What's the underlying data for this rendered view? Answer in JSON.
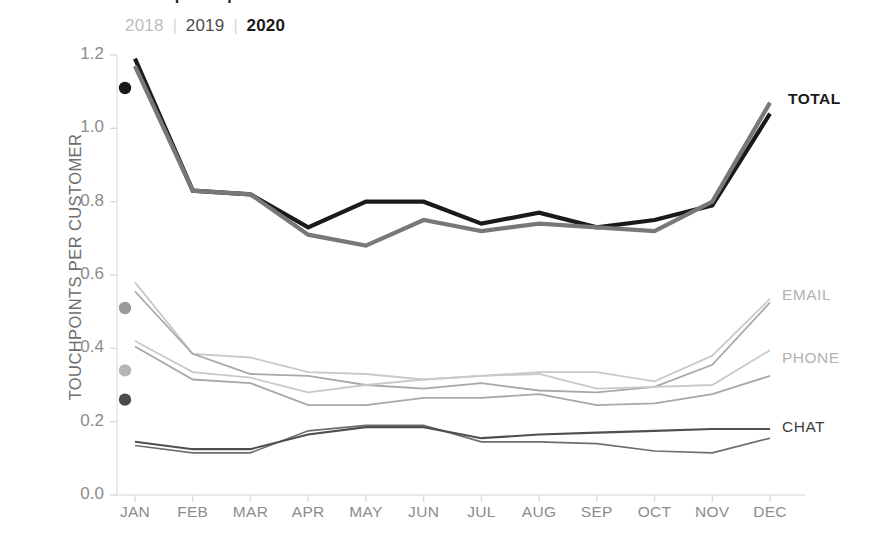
{
  "title": "Touchpoints per customer",
  "legend": {
    "items": [
      {
        "label": "2018",
        "color": "#bdbdbd"
      },
      {
        "label": "2019",
        "color": "#4d4d4d"
      },
      {
        "label": "2020",
        "color": "#1a1a1a"
      }
    ],
    "separator": "|"
  },
  "axes": {
    "y_title": "TOUCHPOINTS PER CUSTOMER",
    "y_ticks": [
      "0.0",
      "0.2",
      "0.4",
      "0.6",
      "0.8",
      "1.0",
      "1.2"
    ],
    "x_ticks": [
      "JAN",
      "FEB",
      "MAR",
      "APR",
      "MAY",
      "JUN",
      "JUL",
      "AUG",
      "SEP",
      "OCT",
      "NOV",
      "DEC"
    ]
  },
  "series_labels": {
    "total": "TOTAL",
    "email": "EMAIL",
    "phone": "PHONE",
    "chat": "CHAT"
  },
  "chart_data": {
    "type": "line",
    "title": "Touchpoints per customer",
    "xlabel": "",
    "ylabel": "TOUCHPOINTS PER CUSTOMER",
    "ylim": [
      0.0,
      1.2
    ],
    "ytick_step": 0.2,
    "grid": false,
    "legend_position": "top-left",
    "categories": [
      "JAN",
      "FEB",
      "MAR",
      "APR",
      "MAY",
      "JUN",
      "JUL",
      "AUG",
      "SEP",
      "OCT",
      "NOV",
      "DEC"
    ],
    "series": [
      {
        "name": "TOTAL 2020",
        "metric": "TOTAL",
        "year": "2020",
        "color": "#1a1a1a",
        "width": 4.2,
        "values": [
          1.19,
          0.83,
          0.82,
          0.73,
          0.8,
          0.8,
          0.74,
          0.77,
          0.73,
          0.75,
          0.79,
          1.04
        ]
      },
      {
        "name": "TOTAL 2019",
        "metric": "TOTAL",
        "year": "2019",
        "color": "#787878",
        "width": 4.2,
        "values": [
          1.17,
          0.83,
          0.82,
          0.71,
          0.68,
          0.75,
          0.72,
          0.74,
          0.73,
          0.72,
          0.8,
          1.07
        ]
      },
      {
        "name": "EMAIL 2018",
        "metric": "EMAIL",
        "year": "2018",
        "color": "#c9c9c9",
        "width": 1.8,
        "values": [
          0.58,
          0.385,
          0.375,
          0.335,
          0.33,
          0.315,
          0.325,
          0.335,
          0.335,
          0.31,
          0.38,
          0.535
        ]
      },
      {
        "name": "EMAIL 2019",
        "metric": "EMAIL",
        "year": "2019",
        "color": "#a8a8a8",
        "width": 1.8,
        "values": [
          0.555,
          0.385,
          0.33,
          0.325,
          0.3,
          0.29,
          0.305,
          0.285,
          0.28,
          0.295,
          0.355,
          0.525
        ]
      },
      {
        "name": "PHONE 2018",
        "metric": "PHONE",
        "year": "2018",
        "color": "#c9c9c9",
        "width": 1.8,
        "values": [
          0.42,
          0.335,
          0.32,
          0.28,
          0.3,
          0.315,
          0.325,
          0.33,
          0.29,
          0.295,
          0.3,
          0.395
        ]
      },
      {
        "name": "PHONE 2019",
        "metric": "PHONE",
        "year": "2019",
        "color": "#a8a8a8",
        "width": 1.8,
        "values": [
          0.405,
          0.315,
          0.305,
          0.245,
          0.245,
          0.265,
          0.265,
          0.275,
          0.245,
          0.25,
          0.275,
          0.325
        ]
      },
      {
        "name": "CHAT 2020",
        "metric": "CHAT",
        "year": "2020",
        "color": "#4f4f4f",
        "width": 2.1,
        "values": [
          0.145,
          0.125,
          0.125,
          0.165,
          0.185,
          0.185,
          0.155,
          0.165,
          0.17,
          0.175,
          0.18,
          0.18
        ]
      },
      {
        "name": "CHAT 2019",
        "metric": "CHAT",
        "year": "2019",
        "color": "#6e6e6e",
        "width": 1.6,
        "values": [
          0.135,
          0.115,
          0.115,
          0.175,
          0.19,
          0.19,
          0.145,
          0.145,
          0.14,
          0.12,
          0.115,
          0.155
        ]
      }
    ],
    "markers": [
      {
        "label": "TOTAL 2018 JAN",
        "metric": "TOTAL",
        "year": "2018",
        "x": "JAN",
        "value": 1.11,
        "color": "#1a1a1a"
      },
      {
        "label": "EMAIL 2020 JAN",
        "metric": "EMAIL",
        "year": "2020",
        "x": "JAN",
        "value": 0.51,
        "color": "#9a9a9a"
      },
      {
        "label": "PHONE 2020 JAN",
        "metric": "PHONE",
        "year": "2020",
        "x": "JAN",
        "value": 0.34,
        "color": "#b5b5b5"
      },
      {
        "label": "CHAT 2018 JAN",
        "metric": "CHAT",
        "year": "2018",
        "x": "JAN",
        "value": 0.26,
        "color": "#4a4a4a"
      }
    ],
    "annotations": [
      {
        "text": "TOTAL",
        "at": "DEC",
        "value": 1.06
      },
      {
        "text": "EMAIL",
        "at": "DEC",
        "value": 0.53
      },
      {
        "text": "PHONE",
        "at": "DEC",
        "value": 0.39
      },
      {
        "text": "CHAT",
        "at": "DEC",
        "value": 0.18
      }
    ]
  }
}
